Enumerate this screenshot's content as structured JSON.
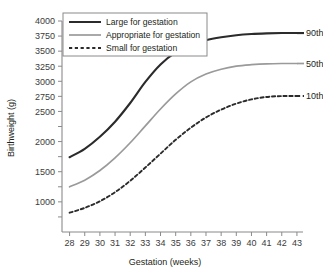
{
  "chart_data": {
    "type": "line",
    "title": "",
    "xlabel": "Gestation (weeks)",
    "ylabel": "Birthweight (g)",
    "xlim": [
      27.5,
      43.4
    ],
    "ylim": [
      500,
      4000
    ],
    "grid": false,
    "legend_position": "top-left",
    "x_tick_labels": [
      "28",
      "29",
      "30",
      "31",
      "32",
      "33",
      "34",
      "35",
      "36",
      "37",
      "38",
      "39",
      "40",
      "41",
      "42",
      "43"
    ],
    "x": [
      28,
      29,
      30,
      31,
      32,
      33,
      34,
      35,
      36,
      37,
      38,
      39,
      40,
      41,
      42,
      43
    ],
    "y_tick_labels": [
      "4000",
      "3750",
      "3500",
      "3250",
      "3000",
      "2750",
      "2500",
      "",
      "2000",
      "",
      "1500",
      "",
      "1000",
      ""
    ],
    "y_ticks": [
      4000,
      3750,
      3500,
      3250,
      3000,
      2750,
      2500,
      2250,
      2000,
      1750,
      1500,
      1250,
      1000,
      750
    ],
    "series": [
      {
        "name": "Large for gestation",
        "end_label": "90th",
        "style": "solid",
        "color": "#2b2b2b",
        "width": 2.1,
        "values": [
          1740,
          1880,
          2080,
          2330,
          2640,
          2990,
          3280,
          3480,
          3600,
          3680,
          3730,
          3765,
          3785,
          3795,
          3800,
          3800
        ]
      },
      {
        "name": "Appropriate for gestation",
        "end_label": "50th",
        "style": "solid",
        "color": "#9a9a9a",
        "width": 1.7,
        "values": [
          1250,
          1360,
          1520,
          1730,
          1980,
          2260,
          2540,
          2790,
          2990,
          3120,
          3200,
          3250,
          3275,
          3290,
          3295,
          3295
        ]
      },
      {
        "name": "Small for gestation",
        "end_label": "10th",
        "style": "dashed",
        "color": "#2b2b2b",
        "width": 1.9,
        "values": [
          820,
          900,
          1010,
          1160,
          1350,
          1570,
          1800,
          2030,
          2230,
          2400,
          2530,
          2630,
          2700,
          2740,
          2755,
          2755
        ]
      }
    ],
    "legend_entries": [
      {
        "label": "Large for gestation",
        "style": "solid",
        "color": "#2b2b2b"
      },
      {
        "label": "Appropriate for gestation",
        "style": "solid",
        "color": "#9a9a9a"
      },
      {
        "label": "Small for gestation",
        "style": "dashed",
        "color": "#2b2b2b"
      }
    ]
  }
}
